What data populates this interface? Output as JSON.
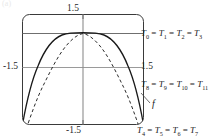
{
  "figure": {
    "caption_remnant": "(a)",
    "ticks": {
      "top": "1.5",
      "left": "-1.5",
      "right": "1.5",
      "bottom": "-1.5"
    },
    "labels": {
      "top_set": "T0 = T1 = T2 = T3",
      "mid_set": "T8 = T9 = T10 = T11",
      "bottom_set": "T4 = T5 = T6 = T7",
      "function": "f"
    },
    "colors": {
      "frame": "#3a3a3a",
      "axis": "#9a9a9a",
      "solid_curve": "#1a1a1a",
      "dashed_curve": "#2a2a2a",
      "text": "#1a1a1a"
    }
  },
  "chart_data": {
    "type": "line",
    "title": "",
    "xlabel": "",
    "ylabel": "",
    "xlim": [
      -1.5,
      1.5
    ],
    "ylim": [
      -1.5,
      1.5
    ],
    "grid": true,
    "legend": "annotations",
    "xticks": [
      -1.5,
      1.5
    ],
    "yticks": [
      -1.5,
      1.5
    ],
    "gridlines": {
      "horizontal": [
        1.5,
        0.0
      ],
      "vertical": [
        0.0
      ]
    },
    "annotations": [
      {
        "text": "T0 = T1 = T2 = T3",
        "x": 1.55,
        "y": 1.02,
        "note": "tangent level at upper horizontal line"
      },
      {
        "text": "T8 = T9 = T10 = T11",
        "x": 1.55,
        "y": -0.42,
        "note": "tangent level right of axis"
      },
      {
        "text": "T4 = T5 = T6 = T7",
        "x": 1.45,
        "y": -1.55,
        "note": "tangent level at bottom"
      },
      {
        "text": "f",
        "x": 1.72,
        "y": -0.95,
        "note": "curve label with leader line"
      }
    ],
    "series": [
      {
        "name": "solid",
        "style": "solid",
        "color": "#1a1a1a",
        "x": [
          -1.5,
          -1.4,
          -1.3,
          -1.2,
          -1.1,
          -1.0,
          -0.9,
          -0.8,
          -0.7,
          -0.6,
          -0.5,
          -0.4,
          -0.3,
          -0.2,
          -0.1,
          0.0,
          0.1,
          0.2,
          0.3,
          0.4,
          0.5,
          0.6,
          0.7,
          0.8,
          0.9,
          1.0,
          1.1,
          1.2,
          1.3,
          1.4,
          1.5
        ],
        "y": [
          -1.5,
          -0.92,
          -0.44,
          -0.07,
          0.22,
          0.46,
          0.64,
          0.77,
          0.87,
          0.93,
          0.97,
          0.99,
          1.0,
          1.0,
          1.0,
          1.0,
          1.0,
          1.0,
          1.0,
          0.99,
          0.97,
          0.93,
          0.87,
          0.77,
          0.64,
          0.46,
          0.22,
          -0.07,
          -0.44,
          -0.92,
          -1.5
        ]
      },
      {
        "name": "dashed",
        "style": "dashed",
        "color": "#2a2a2a",
        "x": [
          -1.5,
          -1.4,
          -1.3,
          -1.2,
          -1.1,
          -1.0,
          -0.9,
          -0.8,
          -0.7,
          -0.6,
          -0.5,
          -0.4,
          -0.3,
          -0.2,
          -0.1,
          0.0,
          0.1,
          0.2,
          0.3,
          0.4,
          0.5,
          0.6,
          0.7,
          0.8,
          0.9,
          1.0,
          1.1,
          1.2,
          1.3,
          1.4,
          1.5
        ],
        "y": [
          -1.95,
          -1.4,
          -0.88,
          -0.44,
          -0.06,
          0.25,
          0.5,
          0.69,
          0.83,
          0.92,
          0.97,
          0.99,
          1.0,
          1.0,
          1.0,
          1.0,
          1.0,
          1.0,
          1.0,
          0.99,
          0.97,
          0.92,
          0.83,
          0.69,
          0.5,
          0.25,
          -0.06,
          -0.44,
          -0.88,
          -1.4,
          -1.95
        ]
      }
    ]
  }
}
